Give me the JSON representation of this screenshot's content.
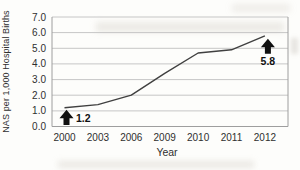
{
  "chart_data": {
    "type": "line",
    "categories": [
      "2000",
      "2003",
      "2006",
      "2009",
      "2010",
      "2011",
      "2012"
    ],
    "values": [
      1.2,
      1.4,
      2.0,
      3.4,
      4.7,
      4.9,
      5.8
    ],
    "title": "",
    "xlabel": "Year",
    "ylabel": "NAS per 1,000 Hospital Births",
    "ylim": [
      0,
      7
    ],
    "ytick_step": 1,
    "ytick_labels": [
      "0.0",
      "1.0",
      "2.0",
      "3.0",
      "4.0",
      "5.0",
      "6.0",
      "7.0"
    ],
    "grid": true,
    "legend": "none",
    "annotations": [
      {
        "category": "2000",
        "label": "1.2",
        "arrow": "up"
      },
      {
        "category": "2012",
        "label": "5.8",
        "arrow": "up"
      }
    ],
    "colors": {
      "line": "#404040",
      "grid": "#c6c6c6",
      "frame": "#9e9e9e",
      "tick_text": "#2f2f2f",
      "annotation": "#111111",
      "background": "#fdfdfb"
    }
  }
}
